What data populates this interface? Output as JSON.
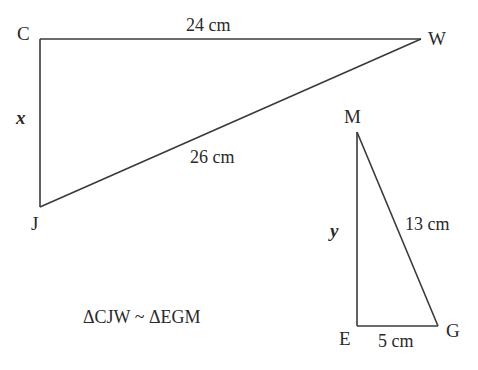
{
  "diagram": {
    "triangle_cjw": {
      "vertices": {
        "C": "C",
        "J": "J",
        "W": "W"
      },
      "labels": {
        "CW": "24 cm",
        "JW": "26 cm",
        "CJ": "x"
      }
    },
    "triangle_egm": {
      "vertices": {
        "E": "E",
        "G": "G",
        "M": "M"
      },
      "labels": {
        "MG": "13 cm",
        "EG": "5 cm",
        "EM": "y"
      }
    },
    "statement": "ΔCJW ~ ΔEGM",
    "colors": {
      "line": "#3a3a3a",
      "text": "#2a2a2a",
      "background": "#ffffff"
    }
  }
}
